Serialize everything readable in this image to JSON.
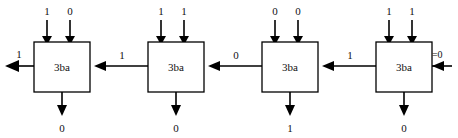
{
  "diagram": {
    "type": "ripple-carry-adder-chain",
    "module_label": "3ba",
    "carry_in": {
      "label_prefix": "Cl",
      "label_subscript": "1",
      "label_suffix": "=0",
      "full_label": "Cl₁=0",
      "value": "0"
    },
    "final_carry_out": "1",
    "stages": [
      {
        "position": 1,
        "label": "3ba",
        "top_inputs": [
          "1",
          "0"
        ],
        "bottom_output": "0",
        "carry_out_left": "1"
      },
      {
        "position": 2,
        "label": "3ba",
        "top_inputs": [
          "1",
          "1"
        ],
        "bottom_output": "0",
        "carry_out_left": "1"
      },
      {
        "position": 3,
        "label": "3ba",
        "top_inputs": [
          "0",
          "0"
        ],
        "bottom_output": "1",
        "carry_out_left": "0"
      },
      {
        "position": 4,
        "label": "3ba",
        "top_inputs": [
          "1",
          "1"
        ],
        "bottom_output": "0",
        "carry_out_left": "1"
      }
    ],
    "colors": {
      "line": "#000000",
      "text": "#111111",
      "background": "#ffffff"
    }
  }
}
